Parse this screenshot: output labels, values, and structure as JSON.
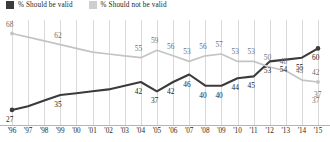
{
  "legend": {
    "items": [
      {
        "label": "% Should be valid",
        "color": "#3b3b3b",
        "key": "dark"
      },
      {
        "label": "% Should not be valid",
        "color": "#cfcfcf",
        "key": "light"
      }
    ]
  },
  "chart_data": {
    "type": "line",
    "title": "",
    "xlabel": "",
    "ylabel": "",
    "ylim": [
      20,
      72
    ],
    "grid": true,
    "legend_position": "top-left",
    "categories": [
      "'96",
      "'97",
      "'98",
      "'99",
      "'00",
      "'01",
      "'02",
      "'03",
      "'04",
      "'05",
      "'06",
      "'07",
      "'08",
      "'09",
      "'10",
      "'11",
      "'12",
      "'13",
      "'14",
      "'15"
    ],
    "series": [
      {
        "name": "% Should be valid",
        "color": "#3b3b3b",
        "values": [
          27,
          29,
          32,
          35,
          36,
          37,
          38,
          40,
          42,
          37,
          42,
          46,
          40,
          40,
          44,
          45,
          53,
          54,
          55,
          60
        ],
        "labels": [
          {
            "index": 0,
            "value": 27,
            "show": true
          },
          {
            "index": 3,
            "value": 35,
            "show": true
          },
          {
            "index": 8,
            "value": 42,
            "show": true
          },
          {
            "index": 9,
            "value": 37,
            "show": true
          },
          {
            "index": 10,
            "value": 42,
            "show": true
          },
          {
            "index": 11,
            "value": 46,
            "show": true
          },
          {
            "index": 12,
            "value": 40,
            "show": true
          },
          {
            "index": 13,
            "value": 40,
            "show": true
          },
          {
            "index": 14,
            "value": 44,
            "show": true
          },
          {
            "index": 15,
            "value": 45,
            "show": true
          },
          {
            "index": 16,
            "value": 53,
            "show": true
          },
          {
            "index": 17,
            "value": 54,
            "show": true
          },
          {
            "index": 18,
            "value": 55,
            "show": true
          },
          {
            "index": 19,
            "value": 60,
            "show": true
          }
        ]
      },
      {
        "name": "% Should not be valid",
        "color": "#c4c4c4",
        "values": [
          68,
          66,
          64,
          62,
          60,
          58,
          57,
          56,
          55,
          59,
          56,
          53,
          56,
          57,
          53,
          53,
          50,
          48,
          43,
          42
        ],
        "labels": [
          {
            "index": 0,
            "value": 68,
            "show": true
          },
          {
            "index": 3,
            "value": 62,
            "show": true
          },
          {
            "index": 8,
            "value": 55,
            "show": true
          },
          {
            "index": 9,
            "value": 59,
            "show": true
          },
          {
            "index": 10,
            "value": 56,
            "show": true
          },
          {
            "index": 11,
            "value": 53,
            "show": true
          },
          {
            "index": 12,
            "value": 56,
            "show": true
          },
          {
            "index": 13,
            "value": 57,
            "show": true
          },
          {
            "index": 14,
            "value": 53,
            "show": true
          },
          {
            "index": 15,
            "value": 53,
            "show": true
          },
          {
            "index": 16,
            "value": 50,
            "show": true
          },
          {
            "index": 17,
            "value": 48,
            "show": true
          },
          {
            "index": 18,
            "value": 43,
            "show": true
          },
          {
            "index": 19,
            "value": 42,
            "show": true
          },
          {
            "index": 20,
            "value": 37,
            "show": true
          }
        ],
        "end_value": 37
      }
    ]
  }
}
